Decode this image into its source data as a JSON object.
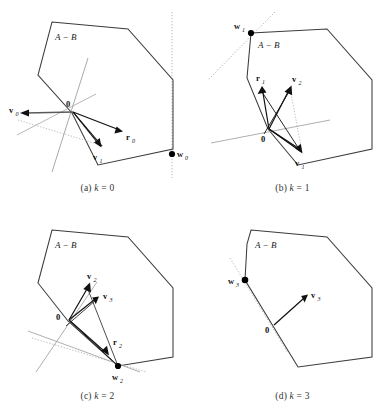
{
  "figure": {
    "type": "multi-panel-geometry-diagram",
    "panel_count": 4,
    "set_label": "A − B",
    "colors": {
      "polygon_stroke": "#3a3a3a",
      "vector_stroke": "#000000",
      "support_line": "#8a8a8a",
      "dotted_line": "#b0a8a0",
      "point_fill": "#000000",
      "caption_text": "#333333",
      "background": "#ffffff"
    }
  },
  "panels": [
    {
      "id": "panel-a",
      "caption": "(a) k = 0",
      "caption_prefix": "(a)",
      "caption_var": "k",
      "caption_value": "0",
      "set_label": "A − B",
      "origin_label": "0",
      "labels": [
        {
          "name": "v0",
          "text": "v",
          "sub": "0"
        },
        {
          "name": "v1",
          "text": "v",
          "sub": "1"
        },
        {
          "name": "r0",
          "text": "r",
          "sub": "0"
        },
        {
          "name": "w0",
          "text": "w",
          "sub": "0"
        }
      ],
      "points": [
        {
          "name": "w0",
          "x": 172,
          "y": 154
        }
      ],
      "origin": {
        "x": 73,
        "y": 112
      },
      "vectors": [
        {
          "name": "v0",
          "from": [
            73,
            112
          ],
          "to": [
            22,
            113
          ]
        },
        {
          "name": "v1",
          "from": [
            73,
            112
          ],
          "to": [
            101,
            147
          ]
        },
        {
          "name": "r0",
          "from": [
            73,
            112
          ],
          "to": [
            122,
            131
          ]
        }
      ],
      "polygon": [
        [
          52,
          22
        ],
        [
          128,
          29
        ],
        [
          173,
          80
        ],
        [
          173,
          149
        ],
        [
          98,
          165
        ],
        [
          72,
          113
        ],
        [
          38,
          75
        ]
      ]
    },
    {
      "id": "panel-b",
      "caption": "(b) k = 1",
      "caption_prefix": "(b)",
      "caption_var": "k",
      "caption_value": "1",
      "set_label": "A − B",
      "origin_label": "0",
      "labels": [
        {
          "name": "w1",
          "text": "w",
          "sub": "1"
        },
        {
          "name": "r1",
          "text": "r",
          "sub": "1"
        },
        {
          "name": "v2",
          "text": "v",
          "sub": "2"
        },
        {
          "name": "v1",
          "text": "v",
          "sub": "1"
        }
      ],
      "points": [
        {
          "name": "w1",
          "x": 251,
          "y": 33
        }
      ],
      "origin": {
        "x": 269,
        "y": 129
      },
      "vectors": [
        {
          "name": "r1",
          "from": [
            269,
            129
          ],
          "to": [
            262,
            86
          ]
        },
        {
          "name": "v2",
          "from": [
            269,
            129
          ],
          "to": [
            291,
            86
          ]
        },
        {
          "name": "v1",
          "from": [
            269,
            129
          ],
          "to": [
            301,
            153
          ]
        }
      ],
      "polygon": [
        [
          251,
          33
        ],
        [
          327,
          29
        ],
        [
          372,
          80
        ],
        [
          372,
          149
        ],
        [
          298,
          165
        ],
        [
          268,
          129
        ],
        [
          247,
          78
        ]
      ]
    },
    {
      "id": "panel-c",
      "caption": "(c) k = 2",
      "caption_prefix": "(c)",
      "caption_var": "k",
      "caption_value": "2",
      "set_label": "A − B",
      "origin_label": "0",
      "labels": [
        {
          "name": "v2",
          "text": "v",
          "sub": "2"
        },
        {
          "name": "v3",
          "text": "v",
          "sub": "3"
        },
        {
          "name": "r2",
          "text": "r",
          "sub": "2"
        },
        {
          "name": "w2",
          "text": "w",
          "sub": "2"
        }
      ],
      "points": [
        {
          "name": "w2",
          "x": 118,
          "y": 366
        }
      ],
      "origin": {
        "x": 69,
        "y": 320
      },
      "vectors": [
        {
          "name": "v2",
          "from": [
            69,
            320
          ],
          "to": [
            89,
            283
          ]
        },
        {
          "name": "v3",
          "from": [
            69,
            320
          ],
          "to": [
            98,
            297
          ]
        },
        {
          "name": "r2",
          "from": [
            69,
            320
          ],
          "to": [
            108,
            355
          ]
        }
      ],
      "polygon": [
        [
          52,
          230
        ],
        [
          128,
          237
        ],
        [
          173,
          288
        ],
        [
          173,
          357
        ],
        [
          118,
          366
        ],
        [
          68,
          321
        ],
        [
          38,
          283
        ]
      ]
    },
    {
      "id": "panel-d",
      "caption": "(d) k = 3",
      "caption_prefix": "(d)",
      "caption_var": "k",
      "caption_value": "3",
      "set_label": "A − B",
      "origin_label": "0",
      "labels": [
        {
          "name": "w3",
          "text": "w",
          "sub": "3"
        },
        {
          "name": "v3",
          "text": "v",
          "sub": "3"
        }
      ],
      "points": [
        {
          "name": "w3",
          "x": 245,
          "y": 280
        }
      ],
      "origin": {
        "x": 274,
        "y": 325
      },
      "vectors": [
        {
          "name": "v3",
          "from": [
            274,
            325
          ],
          "to": [
            307,
            295
          ]
        }
      ],
      "polygon": [
        [
          251,
          230
        ],
        [
          327,
          237
        ],
        [
          372,
          288
        ],
        [
          372,
          357
        ],
        [
          298,
          367
        ],
        [
          245,
          280
        ],
        [
          247,
          244
        ]
      ]
    }
  ]
}
